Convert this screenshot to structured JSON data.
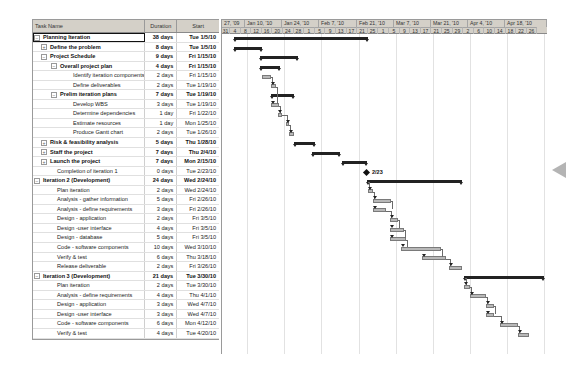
{
  "table": {
    "headers": {
      "name": "Task Name",
      "duration": "Duration",
      "start": "Start"
    },
    "rows": [
      {
        "name": "Planning Iteration",
        "duration": "38 days",
        "start": "Tue 1/5/10",
        "level": 0,
        "summary": true,
        "toggle": "minus",
        "selected": true
      },
      {
        "name": "Define the problem",
        "duration": "8 days",
        "start": "Tue 1/5/10",
        "level": 1,
        "summary": true,
        "toggle": "plus"
      },
      {
        "name": "Project Schedule",
        "duration": "9 days",
        "start": "Fri 1/15/10",
        "level": 1,
        "summary": true,
        "toggle": "minus"
      },
      {
        "name": "Overall project plan",
        "duration": "4 days",
        "start": "Fri 1/15/10",
        "level": 2,
        "summary": true,
        "toggle": "minus"
      },
      {
        "name": "Identify iteration components",
        "duration": "2 days",
        "start": "Fri 1/15/10",
        "level": 3
      },
      {
        "name": "Define deliverables",
        "duration": "2 days",
        "start": "Tue 1/19/10",
        "level": 3
      },
      {
        "name": "Prelim iteration plans",
        "duration": "7 days",
        "start": "Tue 1/19/10",
        "level": 2,
        "summary": true,
        "toggle": "minus"
      },
      {
        "name": "Develop WBS",
        "duration": "3 days",
        "start": "Tue 1/19/10",
        "level": 3
      },
      {
        "name": "Determine dependencies",
        "duration": "1 day",
        "start": "Fri 1/22/10",
        "level": 3
      },
      {
        "name": "Estimate resources",
        "duration": "1 day",
        "start": "Mon 1/25/10",
        "level": 3
      },
      {
        "name": "Produce Gantt chart",
        "duration": "2 days",
        "start": "Tue 1/26/10",
        "level": 3
      },
      {
        "name": "Risk & feasibility analysis",
        "duration": "5 days",
        "start": "Thu 1/28/10",
        "level": 1,
        "summary": true,
        "toggle": "plus"
      },
      {
        "name": "Staff the project",
        "duration": "7 days",
        "start": "Thu 2/4/10",
        "level": 1,
        "summary": true,
        "toggle": "plus"
      },
      {
        "name": "Launch the project",
        "duration": "7 days",
        "start": "Mon 2/15/10",
        "level": 1,
        "summary": true,
        "toggle": "plus"
      },
      {
        "name": "Completion of iteration 1",
        "duration": "0 days",
        "start": "Tue 2/23/10",
        "level": 2
      },
      {
        "name": "Iteration 2 (Development)",
        "duration": "24 days",
        "start": "Wed 2/24/10",
        "level": 0,
        "summary": true,
        "toggle": "minus"
      },
      {
        "name": "Plan iteration",
        "duration": "2 days",
        "start": "Wed 2/24/10",
        "level": 2
      },
      {
        "name": "Analysis - gather information",
        "duration": "5 days",
        "start": "Fri 2/26/10",
        "level": 2
      },
      {
        "name": "Analysis - define requirements",
        "duration": "3 days",
        "start": "Fri 2/26/10",
        "level": 2
      },
      {
        "name": "Design - application",
        "duration": "2 days",
        "start": "Fri 3/5/10",
        "level": 2
      },
      {
        "name": "Design -user interface",
        "duration": "4 days",
        "start": "Fri 3/5/10",
        "level": 2
      },
      {
        "name": "Design - database",
        "duration": "5 days",
        "start": "Fri 3/5/10",
        "level": 2
      },
      {
        "name": "Code - software components",
        "duration": "10 days",
        "start": "Wed 3/10/10",
        "level": 2
      },
      {
        "name": "Verify & test",
        "duration": "6 days",
        "start": "Thu 3/18/10",
        "level": 2
      },
      {
        "name": "Release deliverable",
        "duration": "2 days",
        "start": "Fri 3/26/10",
        "level": 2
      },
      {
        "name": "Iteration 3 (Development)",
        "duration": "21 days",
        "start": "Tue 3/30/10",
        "level": 0,
        "summary": true,
        "toggle": "minus"
      },
      {
        "name": "Plan iteration",
        "duration": "2 days",
        "start": "Tue 3/30/10",
        "level": 2
      },
      {
        "name": "Analysis - define requirements",
        "duration": "4 days",
        "start": "Thu 4/1/10",
        "level": 2
      },
      {
        "name": "Design - application",
        "duration": "3 days",
        "start": "Wed 4/7/10",
        "level": 2
      },
      {
        "name": "Design -user interface",
        "duration": "3 days",
        "start": "Wed 4/7/10",
        "level": 2
      },
      {
        "name": "Code - software components",
        "duration": "6 days",
        "start": "Mon 4/12/10",
        "level": 2
      },
      {
        "name": "Verify & test",
        "duration": "4 days",
        "start": "Tue 4/20/10",
        "level": 2
      }
    ]
  },
  "timeline": {
    "weeks": [
      "27, '09",
      "Jan 10, '10",
      "Jan 24, '10",
      "Feb 7, '10",
      "Feb 21, '10",
      "Mar 7, '10",
      "Mar 21, '10",
      "Apr 4, '10",
      "Apr 18, '10"
    ],
    "days": [
      "31",
      "4",
      "8",
      "12",
      "16",
      "20",
      "24",
      "28",
      "1",
      "5",
      "9",
      "13",
      "17",
      "21",
      "25",
      "1",
      "5",
      "9",
      "13",
      "17",
      "21",
      "25",
      "29",
      "2",
      "6",
      "10",
      "14",
      "18",
      "22",
      "26"
    ],
    "milestone_label": "2/23"
  },
  "bars": [
    {
      "row": 0,
      "type": "summary",
      "x1": 12,
      "x2": 146
    },
    {
      "row": 1,
      "type": "summary",
      "x1": 12,
      "x2": 40
    },
    {
      "row": 2,
      "type": "summary",
      "x1": 38,
      "x2": 76
    },
    {
      "row": 3,
      "type": "summary",
      "x1": 38,
      "x2": 58
    },
    {
      "row": 4,
      "type": "task",
      "x1": 40,
      "x2": 49
    },
    {
      "row": 5,
      "type": "task",
      "x1": 49,
      "x2": 54
    },
    {
      "row": 6,
      "type": "summary",
      "x1": 49,
      "x2": 72
    },
    {
      "row": 7,
      "type": "task",
      "x1": 49,
      "x2": 57
    },
    {
      "row": 8,
      "type": "task",
      "x1": 56,
      "x2": 60
    },
    {
      "row": 9,
      "type": "task",
      "x1": 64,
      "x2": 67
    },
    {
      "row": 10,
      "type": "task",
      "x1": 67,
      "x2": 72
    },
    {
      "row": 11,
      "type": "summary",
      "x1": 72,
      "x2": 93
    },
    {
      "row": 12,
      "type": "summary",
      "x1": 90,
      "x2": 118
    },
    {
      "row": 13,
      "type": "summary",
      "x1": 120,
      "x2": 145
    },
    {
      "row": 14,
      "type": "milestone",
      "x1": 144,
      "x2": 144
    },
    {
      "row": 15,
      "type": "summary",
      "x1": 145,
      "x2": 240
    },
    {
      "row": 16,
      "type": "task",
      "x1": 146,
      "x2": 151
    },
    {
      "row": 17,
      "type": "task",
      "x1": 151,
      "x2": 169
    },
    {
      "row": 18,
      "type": "task",
      "x1": 151,
      "x2": 164
    },
    {
      "row": 19,
      "type": "task",
      "x1": 168,
      "x2": 176
    },
    {
      "row": 20,
      "type": "task",
      "x1": 168,
      "x2": 182
    },
    {
      "row": 21,
      "type": "task",
      "x1": 168,
      "x2": 184
    },
    {
      "row": 22,
      "type": "task",
      "x1": 179,
      "x2": 219
    },
    {
      "row": 23,
      "type": "task",
      "x1": 200,
      "x2": 224
    },
    {
      "row": 24,
      "type": "task",
      "x1": 227,
      "x2": 240
    },
    {
      "row": 25,
      "type": "summary",
      "x1": 242,
      "x2": 322
    },
    {
      "row": 26,
      "type": "task",
      "x1": 242,
      "x2": 248
    },
    {
      "row": 27,
      "type": "task",
      "x1": 248,
      "x2": 264
    },
    {
      "row": 28,
      "type": "task",
      "x1": 264,
      "x2": 272
    },
    {
      "row": 29,
      "type": "task",
      "x1": 264,
      "x2": 272
    },
    {
      "row": 30,
      "type": "task",
      "x1": 278,
      "x2": 296
    },
    {
      "row": 31,
      "type": "task",
      "x1": 296,
      "x2": 307
    }
  ],
  "colors": {
    "header_bg": "#d4d0c8",
    "summary_bar": "#222222",
    "task_bar": "#b8b8b8",
    "grid_line": "#e2e2e2"
  }
}
